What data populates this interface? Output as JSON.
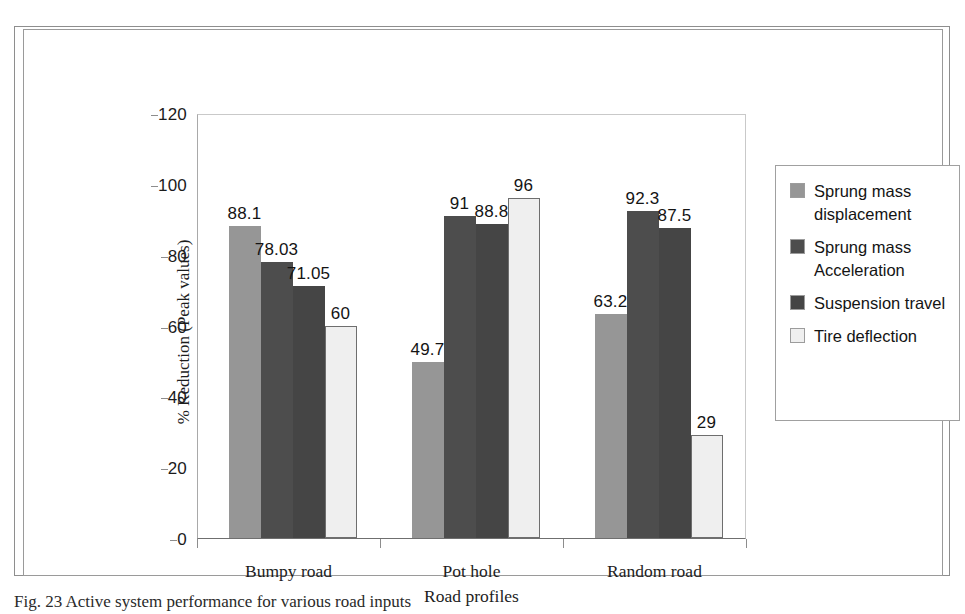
{
  "figure": {
    "caption": "Fig. 23 Active system performance for various road inputs"
  },
  "legend": {
    "items": [
      {
        "label": "Sprung mass displacement",
        "color": "#969696"
      },
      {
        "label": "Sprung mass Acceleration",
        "color": "#4d4d4d"
      },
      {
        "label": "Suspension travel",
        "color": "#454545"
      },
      {
        "label": "Tire deflection",
        "color": "#efefef"
      }
    ]
  },
  "chart_data": {
    "type": "bar",
    "title": "",
    "xlabel": "Road profiles",
    "ylabel": "% Reduction (Peak values)",
    "ylim": [
      0,
      120
    ],
    "yticks": [
      0,
      20,
      40,
      60,
      80,
      100,
      120
    ],
    "ytick_labels": [
      "0",
      "20",
      "40",
      "60",
      "80",
      "100",
      "120"
    ],
    "grid": false,
    "legend_position": "right",
    "categories": [
      "Bumpy road",
      "Pot hole",
      "Random road"
    ],
    "series": [
      {
        "name": "Sprung mass displacement",
        "color": "#969696",
        "values": [
          88.1,
          49.7,
          63.2
        ],
        "labels": [
          "88.1",
          "49.7",
          "63.2"
        ]
      },
      {
        "name": "Sprung mass Acceleration",
        "color": "#4d4d4d",
        "values": [
          78.03,
          91,
          92.3
        ],
        "labels": [
          "78.03",
          "91",
          "92.3"
        ]
      },
      {
        "name": "Suspension travel",
        "color": "#454545",
        "values": [
          71.05,
          88.8,
          87.5
        ],
        "labels": [
          "71.05",
          "88.8",
          "87.5"
        ]
      },
      {
        "name": "Tire deflection",
        "color": "#efefef",
        "values": [
          60,
          96,
          29
        ],
        "labels": [
          "60",
          "96",
          "29"
        ]
      }
    ]
  }
}
